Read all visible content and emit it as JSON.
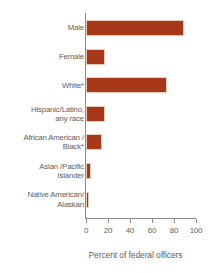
{
  "chart_data": {
    "type": "bar",
    "orientation": "horizontal",
    "title": "",
    "subtitle": "",
    "xlabel": "Percent of federal officers",
    "ylabel": "",
    "categories": [
      "Male",
      "Female",
      "White*",
      "Hispanic/Latino,\nany race",
      "African American /\nBlack*",
      "Asian /Pacific\nIslander",
      "Native American/\nAlaskan"
    ],
    "values": [
      87,
      15,
      72,
      15,
      13,
      2.5,
      1
    ],
    "xlim": [
      0,
      100
    ],
    "xticks": [
      0,
      20,
      40,
      60,
      80,
      100
    ],
    "xtick_labels": [
      "0",
      "20",
      "40",
      "60",
      "80",
      "100"
    ],
    "grid": false,
    "legend": false,
    "bar_color": "#A8381A",
    "axis_color": "#8d8d8d",
    "text_color": "#5d5d5d"
  },
  "axis": {
    "x_title": "Percent of federal officers"
  }
}
